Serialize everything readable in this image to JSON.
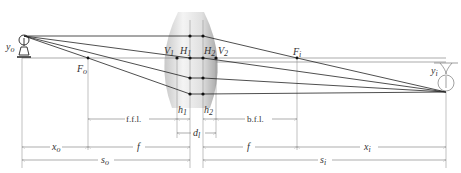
{
  "diagram": {
    "labels": {
      "object": "y",
      "object_sub": "o",
      "image": "y",
      "image_sub": "i",
      "V1": "V",
      "V1_sub": "1",
      "H1": "H",
      "H1_sub": "1",
      "H2": "H",
      "H2_sub": "2",
      "V2": "V",
      "V2_sub": "2",
      "Fo": "F",
      "Fo_sub": "o",
      "Fi": "F",
      "Fi_sub": "i"
    },
    "dimensions": {
      "ffl": "f.f.l.",
      "bfl": "b.f.l.",
      "h1": "h",
      "h1_sub": "1",
      "h2": "h",
      "h2_sub": "2",
      "dl": "d",
      "dl_sub": "l",
      "xo": "x",
      "xo_sub": "o",
      "f_left": "f",
      "f_right": "f",
      "xi": "x",
      "xi_sub": "i",
      "so": "s",
      "so_sub": "o",
      "si": "s",
      "si_sub": "i"
    },
    "positions": {
      "object_x": 22,
      "Fo_x": 88,
      "V1_x": 177,
      "H1_x": 190,
      "H2_x": 203,
      "V2_x": 216,
      "Fi_x": 297,
      "image_x": 446,
      "axis_y": 58
    },
    "colors": {
      "ray": "#222222",
      "lens_light": "#f2f2f2",
      "lens_dark": "#b5b5b5",
      "dimension": "#777777"
    }
  }
}
